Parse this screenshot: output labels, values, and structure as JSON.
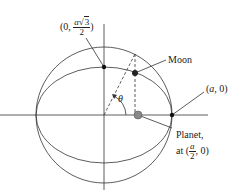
{
  "diagram": {
    "labels": {
      "top_point": {
        "open": "(0, ",
        "num_var": "a",
        "num_root": "3",
        "den": "2",
        "close": ")"
      },
      "moon": "Moon",
      "right_point": {
        "open": "(",
        "var": "a",
        "close": ", 0)"
      },
      "planet_line1": "Planet,",
      "planet_line2": {
        "prefix": "at (",
        "num": "a",
        "den": "2",
        "suffix": ", 0)"
      },
      "angle": "θ"
    },
    "colors": {
      "stroke": "#333333",
      "planet_fill": "#888888",
      "dot_fill": "#111111"
    }
  }
}
